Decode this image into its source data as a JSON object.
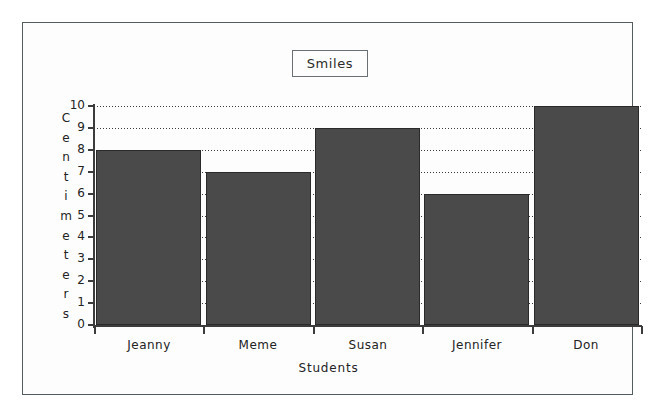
{
  "chart_data": {
    "type": "bar",
    "title": "Smiles",
    "xlabel": "Students",
    "ylabel": "Centimeters",
    "categories": [
      "Jeanny",
      "Meme",
      "Susan",
      "Jennifer",
      "Don"
    ],
    "values": [
      8,
      7,
      9,
      6,
      10
    ],
    "ylim": [
      0,
      10
    ],
    "ytick_labels": [
      "10",
      "9",
      "8",
      "7",
      "6",
      "5",
      "4",
      "3",
      "2",
      "1",
      "0"
    ],
    "ytick_values": [
      10,
      9,
      8,
      7,
      6,
      5,
      4,
      3,
      2,
      1,
      0
    ],
    "grid": "horizontal-dotted",
    "legend": "none",
    "bar_color": "#4a4a4a",
    "bar_border_color": "#2a2a2a",
    "axis_color": "#3c3c3c",
    "background_color": "#fdfdfd",
    "frame_color": "#555c60"
  }
}
